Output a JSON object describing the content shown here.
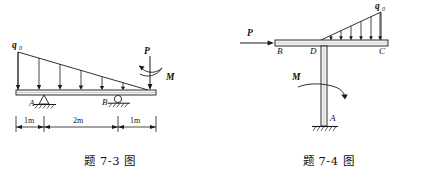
{
  "page": {
    "background_color": "#ffffff",
    "line_color": "#1a1a1a"
  },
  "figures": [
    {
      "id": "fig-7-3",
      "caption": "题 7-3 图",
      "caption_number": "7-3",
      "description": "Simply supported overhanging beam with triangular distributed load, pin support A, roller support B, end force P and moment M",
      "labels": {
        "distributed_load": "q",
        "distributed_load_sub": "0",
        "support_a": "A",
        "support_b": "B",
        "force_p": "P",
        "moment_m": "M"
      },
      "dimensions": [
        {
          "label": "1m",
          "value": 1,
          "unit": "m"
        },
        {
          "label": "2m",
          "value": 2,
          "unit": "m"
        },
        {
          "label": "1m",
          "value": 1,
          "unit": "m"
        }
      ],
      "supports": [
        {
          "name": "A",
          "type": "pin"
        },
        {
          "name": "B",
          "type": "roller"
        }
      ],
      "loads": [
        {
          "name": "q0",
          "type": "triangular-distributed",
          "direction": "down",
          "max_at": "left-end"
        },
        {
          "name": "P",
          "type": "point-force",
          "direction": "down",
          "at": "right-end"
        },
        {
          "name": "M",
          "type": "moment",
          "at": "right-end"
        }
      ]
    },
    {
      "id": "fig-7-4",
      "caption": "题 7-4 图",
      "caption_number": "7-4",
      "description": "L-shaped frame, fixed at base A, horizontal force P at B, triangular distributed load on DC, moment M on column",
      "labels": {
        "distributed_load": "q",
        "distributed_load_sub": "0",
        "force_p": "P",
        "moment_m": "M",
        "node_a": "A",
        "node_b": "B",
        "node_c": "C",
        "node_d": "D"
      },
      "supports": [
        {
          "name": "A",
          "type": "fixed"
        }
      ],
      "loads": [
        {
          "name": "P",
          "type": "point-force",
          "direction": "right",
          "at": "B"
        },
        {
          "name": "q0",
          "type": "triangular-distributed",
          "direction": "down",
          "max_at": "C",
          "span": "D-C"
        },
        {
          "name": "M",
          "type": "moment",
          "at": "column"
        }
      ]
    }
  ]
}
